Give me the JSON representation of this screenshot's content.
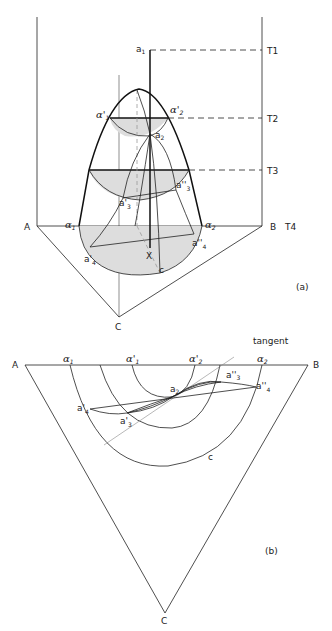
{
  "figure_a": {
    "caption": "(a)",
    "vertices": {
      "A": "A",
      "B": "B",
      "C": "C"
    },
    "temperatures": [
      "T1",
      "T2",
      "T3",
      "T4"
    ],
    "points": {
      "a1": "a",
      "a1_sub": "1",
      "a2": "a",
      "a2_sub": "2",
      "a3p": "a'",
      "a3p_sub": "3",
      "a3pp": "a''",
      "a3pp_sub": "3",
      "a4p": "a'",
      "a4p_sub": "4",
      "a4pp": "a''",
      "a4pp_sub": "4",
      "X": "X",
      "c": "c"
    },
    "alphas": {
      "alpha1": "α",
      "alpha1_sub": "1",
      "alpha2": "α",
      "alpha2_sub": "2",
      "alpha1p": "α'",
      "alpha1p_sub": "1",
      "alpha2p": "α'",
      "alpha2p_sub": "2"
    }
  },
  "figure_b": {
    "caption": "(b)",
    "vertices": {
      "A": "A",
      "B": "B",
      "C": "C"
    },
    "tangent_label": "tangent",
    "points": {
      "a2": "a",
      "a2_sub": "2",
      "a3p": "a'",
      "a3p_sub": "3",
      "a3pp": "a''",
      "a3pp_sub": "3",
      "a4p": "a'",
      "a4p_sub": "4",
      "a4pp": "a''",
      "a4pp_sub": "4",
      "c": "c"
    },
    "alphas": {
      "alpha1": "α",
      "alpha1_sub": "1",
      "alpha1p": "α'",
      "alpha1p_sub": "1",
      "alpha2p": "α'",
      "alpha2p_sub": "2",
      "alpha2": "α",
      "alpha2_sub": "2"
    }
  }
}
